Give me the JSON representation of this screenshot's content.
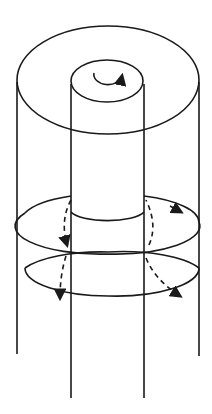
{
  "diagram": {
    "title": "",
    "stroke_color": "#1a1a1a",
    "background": "#ffffff",
    "elements": [
      {
        "name": "outer-cylinder",
        "type": "cylinder"
      },
      {
        "name": "inner-cylinder",
        "type": "cylinder"
      },
      {
        "name": "top-circulation-arrow",
        "type": "curved-arrow",
        "direction": "counterclockwise"
      },
      {
        "name": "upper-ring-loop",
        "type": "ellipse-loop",
        "arrows": 2
      },
      {
        "name": "lower-ring-loop",
        "type": "ellipse-loop",
        "arrows": 2
      }
    ]
  }
}
